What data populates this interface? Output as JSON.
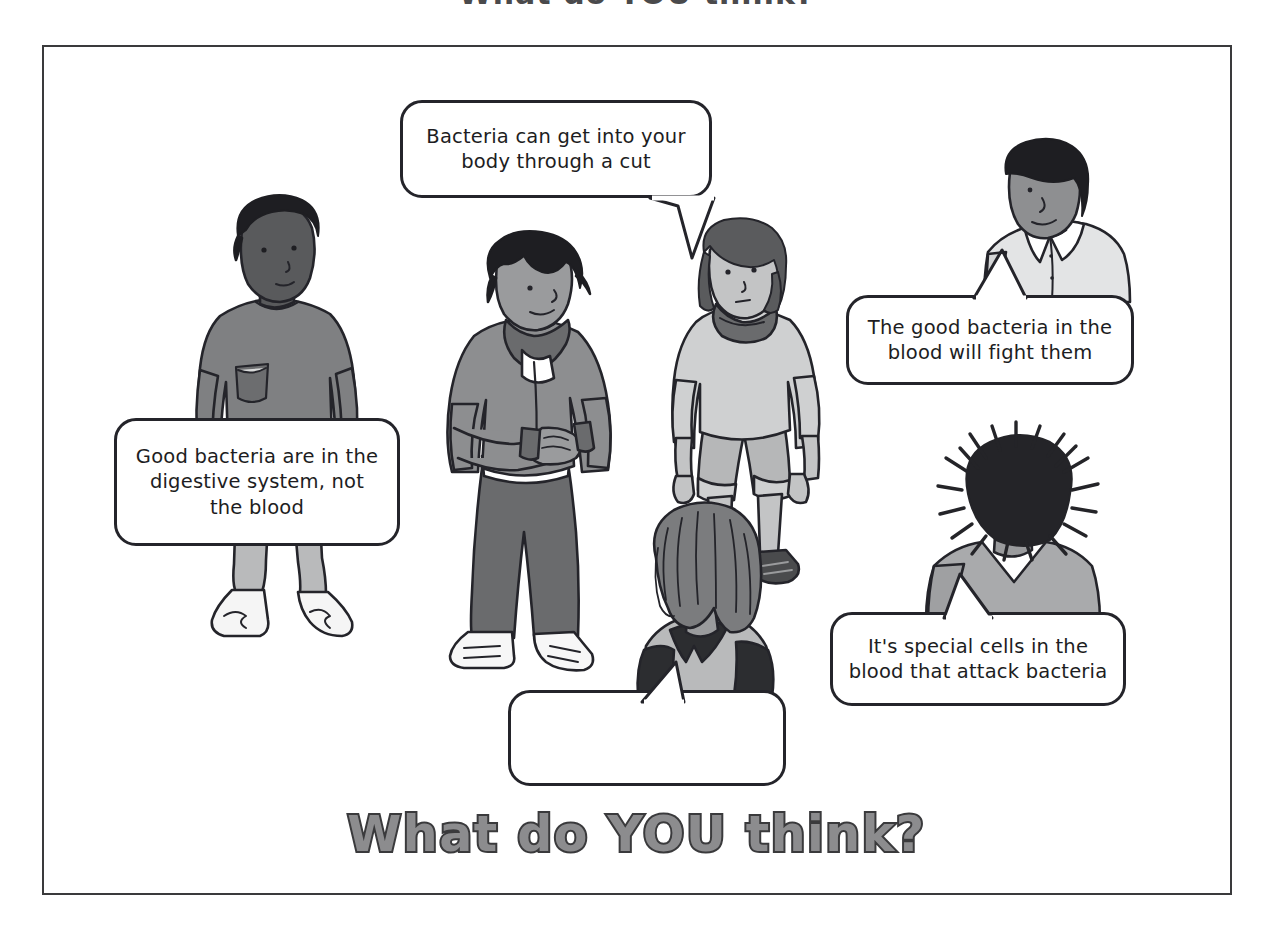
{
  "page": {
    "top_title_partial": "What do YOU think?",
    "bottom_title": "What do YOU think?",
    "frame_color": "#3a3a3c",
    "background": "#ffffff",
    "ink_color": "#24242a"
  },
  "speech_bubbles": [
    {
      "id": "bubble-top",
      "speaker": "girl-standing",
      "text": "Bacteria can get into your body through a cut",
      "tail_direction": "down-left"
    },
    {
      "id": "bubble-left",
      "speaker": "boy-tshirt",
      "text": "Good bacteria are in the digestive system, not the blood",
      "tail_direction": "none"
    },
    {
      "id": "bubble-right-upper",
      "speaker": "boy-collared-shirt",
      "text": "The good bacteria in the blood will fight them",
      "tail_direction": "up-left"
    },
    {
      "id": "bubble-right-lower",
      "speaker": "figure-spiky-hair",
      "text": "It's special cells in the blood that attack bacteria",
      "tail_direction": "up"
    },
    {
      "id": "bubble-empty",
      "speaker": "girl-back-view",
      "text": "",
      "tail_direction": "up-right"
    }
  ],
  "characters": [
    {
      "id": "boy-tshirt",
      "description": "Boy with dark skin and short curly hair wearing a grey t-shirt with chest pocket, light grey trousers and white trainers",
      "skin": "#595a5c",
      "hair": "#1e1e22",
      "top": "#7f8082",
      "bottom": "#b9babb",
      "shoes": "#f2f2f2"
    },
    {
      "id": "boy-hoodie",
      "description": "Boy with spiky dark hair in a grey zip-up hoodie looking down at his hands, dark grey trousers and white trainers",
      "skin": "#9a9b9d",
      "hair": "#1e1e22",
      "top": "#8d8e90",
      "bottom": "#6a6b6d",
      "shoes": "#f7f7f7"
    },
    {
      "id": "girl-standing",
      "description": "Girl with shoulder-length hair in a pale grey jumper with cowl neck, cropped trousers and dark trainers",
      "skin": "#c3c4c5",
      "hair": "#5a5b5d",
      "top": "#cfd0d1",
      "bottom": "#b6b7b8",
      "shoes": "#4a4b4d"
    },
    {
      "id": "girl-back-view",
      "description": "Girl seen from behind with long wavy hair, dark top and light grey pinafore straps",
      "hair": "#7b7c7e",
      "top": "#2c2d30",
      "bottom": "#b9babb"
    },
    {
      "id": "boy-collared-shirt",
      "description": "Boy with dark skin and short hair in a pale collared shirt, upper body only",
      "skin": "#8e8f91",
      "hair": "#1e1e22",
      "top": "#e3e4e5"
    },
    {
      "id": "figure-spiky-hair",
      "description": "Figure seen from behind with very spiky dark hair and a grey top",
      "hair": "#242428",
      "top": "#a9aaac"
    }
  ]
}
